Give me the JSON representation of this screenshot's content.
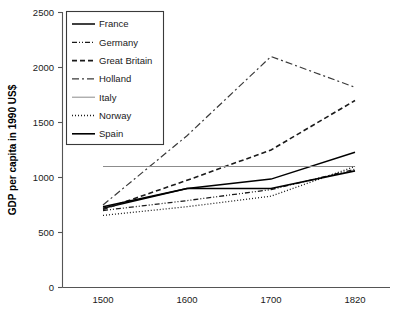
{
  "chart": {
    "type": "line",
    "title": "",
    "xlabel": "",
    "ylabel": "GDP per capita in 1990 US$"
  },
  "axes": {
    "y_ticks": [
      "0",
      "500",
      "1000",
      "1500",
      "2000",
      "2500"
    ],
    "x_ticks": [
      "1500",
      "1600",
      "1700",
      "1820"
    ]
  },
  "legend": {
    "items": [
      {
        "label": "France",
        "style": "solid",
        "color": "#000000"
      },
      {
        "label": "Germany",
        "style": "dash-dot-dot",
        "color": "#1a1a1a"
      },
      {
        "label": "Great Britain",
        "style": "dashed",
        "color": "#1a1a1a"
      },
      {
        "label": "Holland",
        "style": "dash-dot",
        "color": "#3a3a3a"
      },
      {
        "label": "Italy",
        "style": "solid-thin",
        "color": "#8c8c8c"
      },
      {
        "label": "Norway",
        "style": "dotted",
        "color": "#1a1a1a"
      },
      {
        "label": "Spain",
        "style": "solid",
        "color": "#000000"
      }
    ]
  },
  "chart_data": {
    "type": "line",
    "title": "",
    "xlabel": "",
    "ylabel": "GDP per capita in 1990 US$",
    "categories": [
      "1500",
      "1600",
      "1700",
      "1820"
    ],
    "x": [
      1500,
      1600,
      1700,
      1820
    ],
    "ylim": [
      0,
      2500
    ],
    "yticks": [
      0,
      500,
      1000,
      1500,
      2000,
      2500
    ],
    "grid": false,
    "legend_position": "top-left",
    "series": [
      {
        "name": "France",
        "values": [
          720,
          900,
          985,
          1230
        ]
      },
      {
        "name": "Germany",
        "values": [
          700,
          790,
          890,
          1075
        ]
      },
      {
        "name": "Great Britain",
        "values": [
          710,
          975,
          1250,
          1700
        ]
      },
      {
        "name": "Holland",
        "values": [
          750,
          1380,
          2100,
          1820
        ]
      },
      {
        "name": "Italy",
        "values": [
          1100,
          1100,
          1100,
          1100
        ]
      },
      {
        "name": "Norway",
        "values": [
          655,
          735,
          830,
          1100
        ]
      },
      {
        "name": "Spain",
        "values": [
          735,
          900,
          900,
          1060
        ]
      }
    ]
  }
}
